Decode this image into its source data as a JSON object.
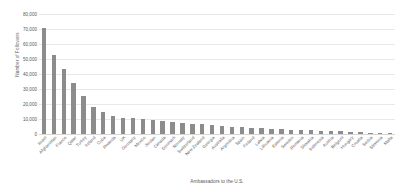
{
  "chart_data": {
    "type": "bar",
    "title": "",
    "xlabel": "Ambassadors to the U.S.",
    "ylabel": "Number of Followers",
    "ylim": [
      0,
      80000
    ],
    "ytick_values": [
      0,
      10000,
      20000,
      30000,
      40000,
      50000,
      60000,
      70000,
      80000
    ],
    "ytick_labels": [
      "0",
      "10,000",
      "20,000",
      "30,000",
      "40,000",
      "50,000",
      "60,000",
      "70,000",
      "80,000"
    ],
    "grid": "horizontal",
    "legend": "none",
    "bar_color": "#8c8c8c",
    "gridline_color": "#e8e8e8",
    "text_color": "#58595b",
    "categories": [
      "Israel",
      "Afghanistan",
      "France",
      "Qatar",
      "Turkey",
      "Ireland",
      "Cuba",
      "Rwanda",
      "UK",
      "Germany",
      "Mexico",
      "Jordan",
      "Canada",
      "Denmark",
      "Norway",
      "Switzerland",
      "New Zealand",
      "Georgia",
      "Australia",
      "Argentina",
      "Spain",
      "Finland",
      "Latvia",
      "Lithuania",
      "Estonia",
      "Sweden",
      "Romania",
      "Slovakia",
      "Indonesia",
      "Austria",
      "Belgium",
      "Hungary",
      "Croatia",
      "Serbia",
      "Slovenia",
      "Malta"
    ],
    "values": [
      71000,
      52500,
      43500,
      34000,
      25500,
      18000,
      14500,
      12000,
      11000,
      10500,
      10000,
      9500,
      9000,
      8000,
      7500,
      7000,
      6500,
      6000,
      5500,
      5000,
      4500,
      4200,
      4000,
      3500,
      3200,
      3000,
      2800,
      2500,
      2200,
      2000,
      1800,
      1500,
      1200,
      900,
      600,
      400
    ]
  }
}
